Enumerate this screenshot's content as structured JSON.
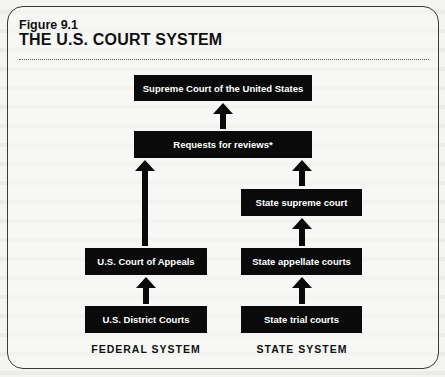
{
  "figure": {
    "number": "Figure 9.1",
    "title": "THE U.S. COURT SYSTEM"
  },
  "nodes": {
    "supreme_court": "Supreme Court of the United States",
    "requests": "Requests for reviews*",
    "state_supreme": "State supreme court",
    "court_of_appeals": "U.S. Court of Appeals",
    "state_appellate": "State appellate courts",
    "district_courts": "U.S. District Courts",
    "state_trial": "State trial courts"
  },
  "labels": {
    "federal": "FEDERAL SYSTEM",
    "state": "STATE SYSTEM"
  },
  "edges": [
    {
      "from": "requests",
      "to": "supreme_court"
    },
    {
      "from": "court_of_appeals",
      "to": "requests"
    },
    {
      "from": "state_supreme",
      "to": "requests"
    },
    {
      "from": "state_appellate",
      "to": "state_supreme"
    },
    {
      "from": "district_courts",
      "to": "court_of_appeals"
    },
    {
      "from": "state_trial",
      "to": "state_appellate"
    }
  ],
  "colors": {
    "box_fill": "#0a0a0a",
    "box_text": "#ffffff",
    "background": "#f4f4f2"
  }
}
